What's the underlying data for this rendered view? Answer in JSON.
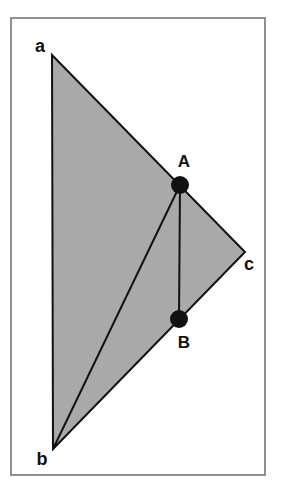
{
  "diagram": {
    "type": "geometry-triangle",
    "frame": {
      "x": 11,
      "y": 18,
      "width": 254,
      "height": 457,
      "stroke": "#6b6b6b"
    },
    "triangle": {
      "fill": "#a9a9a9",
      "stroke": "#111111",
      "vertices": [
        "a",
        "b",
        "c"
      ]
    },
    "vertices": {
      "a": {
        "label": "a",
        "x": 52,
        "y": 55,
        "label_x": 40,
        "label_y": 52
      },
      "b": {
        "label": "b",
        "x": 53,
        "y": 449,
        "label_x": 42,
        "label_y": 465
      },
      "c": {
        "label": "c",
        "x": 245,
        "y": 252,
        "label_x": 249,
        "label_y": 270
      }
    },
    "points": {
      "A": {
        "label": "A",
        "x": 180,
        "y": 185,
        "r": 9,
        "label_x": 184,
        "label_y": 167
      },
      "B": {
        "label": "B",
        "x": 179,
        "y": 319,
        "r": 9,
        "label_x": 184,
        "label_y": 348
      }
    },
    "segments": [
      {
        "from": "b",
        "to": "A"
      },
      {
        "from": "A",
        "to": "B"
      }
    ],
    "colors": {
      "fill": "#a9a9a9",
      "line": "#111111",
      "point": "#111111",
      "frame": "#6b6b6b"
    }
  }
}
